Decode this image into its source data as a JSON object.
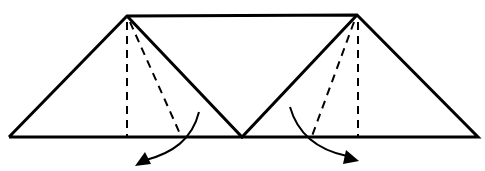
{
  "diagram": {
    "type": "origami-fold-diagram",
    "colors": {
      "line": "#000000",
      "background": "#ffffff"
    },
    "outline": {
      "baseline": {
        "x1": 9,
        "y1": 137,
        "x2": 478,
        "y2": 137
      },
      "top_edge": {
        "x1": 127,
        "y1": 16,
        "x2": 357,
        "y2": 15
      },
      "left_apex": {
        "x": 127,
        "y": 16
      },
      "right_apex": {
        "x": 357,
        "y": 15
      },
      "center_valley": {
        "x": 242,
        "y": 137
      }
    },
    "fold_lines": [
      {
        "id": "left-vertical",
        "x1": 127,
        "y1": 16,
        "x2": 127,
        "y2": 137,
        "style": "dashed"
      },
      {
        "id": "left-diagonal",
        "x1": 128,
        "y1": 17,
        "x2": 181,
        "y2": 136,
        "style": "dashed"
      },
      {
        "id": "right-vertical",
        "x1": 358,
        "y1": 15,
        "x2": 358,
        "y2": 137,
        "style": "dashed"
      },
      {
        "id": "right-diagonal",
        "x1": 356,
        "y1": 16,
        "x2": 312,
        "y2": 136,
        "style": "dashed"
      }
    ],
    "arrows": [
      {
        "id": "left-fold-arrow",
        "direction": "down-left",
        "path": "M199,112 C190,140 170,152 146,160",
        "head_at": [
          137,
          164
        ]
      },
      {
        "id": "right-fold-arrow",
        "direction": "down-right",
        "path": "M290,107 C300,135 320,150 348,158",
        "head_at": [
          358,
          160
        ]
      }
    ]
  }
}
